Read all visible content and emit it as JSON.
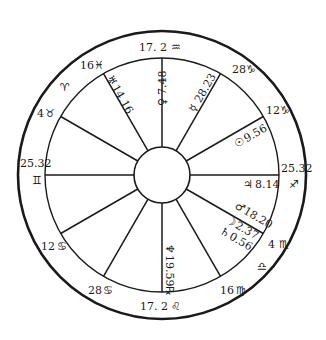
{
  "chart": {
    "type": "astrological natal wheel",
    "center": {
      "x": 162,
      "y": 175
    },
    "radii": {
      "outer": 144,
      "inner": 117,
      "hub": 28
    },
    "colors": {
      "ink": "#1a1a1a",
      "background": "#ffffff"
    }
  },
  "cusps": [
    {
      "id": "mc",
      "degree": "17. 2",
      "sign": "♒",
      "sign_name": "aquarius"
    },
    {
      "id": "cusp-11",
      "degree": "28",
      "sign": "♑",
      "sign_name": "capricorn"
    },
    {
      "id": "cusp-12",
      "degree": "12",
      "sign": "♑",
      "sign_name": "capricorn"
    },
    {
      "id": "asc",
      "degree": "25.32",
      "sign": "♐",
      "sign_name": "sagittarius"
    },
    {
      "id": "cusp-2",
      "degree": "4",
      "sign": "♏",
      "sign_name": "scorpio"
    },
    {
      "id": "cusp-3",
      "degree": "16",
      "sign": "♍",
      "sign_name": "virgo"
    },
    {
      "id": "ic",
      "degree": "17. 2",
      "sign": "♌",
      "sign_name": "leo"
    },
    {
      "id": "cusp-5",
      "degree": "28",
      "sign": "♋",
      "sign_name": "cancer"
    },
    {
      "id": "cusp-6",
      "degree": "12",
      "sign": "♋",
      "sign_name": "cancer"
    },
    {
      "id": "dsc",
      "degree": "25.32",
      "sign": "♊",
      "sign_name": "gemini"
    },
    {
      "id": "cusp-8",
      "degree": "4",
      "sign": "♉",
      "sign_name": "taurus"
    },
    {
      "id": "cusp-9",
      "degree": "16",
      "sign": "♓",
      "sign_name": "pisces"
    }
  ],
  "intercepted_signs": [
    {
      "sign": "♈",
      "sign_name": "aries"
    },
    {
      "sign": "♎",
      "sign_name": "libra"
    }
  ],
  "planets": [
    {
      "id": "uranus",
      "glyph": "♅",
      "position": "14.16"
    },
    {
      "id": "venus",
      "glyph": "♀",
      "position": "7.48"
    },
    {
      "id": "mercury",
      "glyph": "☿",
      "position": "28.23"
    },
    {
      "id": "sun",
      "glyph": "☉",
      "position": "9.56"
    },
    {
      "id": "jupiter",
      "glyph": "♃",
      "position": "8.14"
    },
    {
      "id": "mars",
      "glyph": "♂",
      "position": "18.20"
    },
    {
      "id": "moon",
      "glyph": "☽",
      "position": "2.37"
    },
    {
      "id": "saturn",
      "glyph": "♄",
      "position": "0.56"
    },
    {
      "id": "neptune",
      "glyph": "♆",
      "position": "19.59℞"
    }
  ]
}
